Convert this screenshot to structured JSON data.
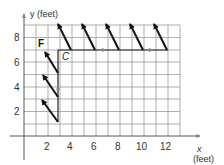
{
  "diagram": {
    "y_axis_label": "y (feet)",
    "x_axis_label_var": "x",
    "x_axis_label_unit": "(feet)",
    "x_ticks": [
      "2",
      "4",
      "6",
      "8",
      "10",
      "12"
    ],
    "y_ticks": [
      "2",
      "4",
      "6",
      "8"
    ],
    "force_label": "F",
    "path_label": "C",
    "grid": {
      "x_range": [
        0,
        13
      ],
      "y_range": [
        0,
        9
      ],
      "spacing": 1
    },
    "path": "vertical segment x=3 from y=1 to y=7, then horizontal segment y=7 from x=3 to x=12",
    "force_vectors": "constant vector F (approx -1, +2.2 units) drawn at points along path C",
    "colors": {
      "grid": "#9a9a9a",
      "axes": "#555555",
      "arrows": "#111111",
      "path": "#222222"
    }
  }
}
